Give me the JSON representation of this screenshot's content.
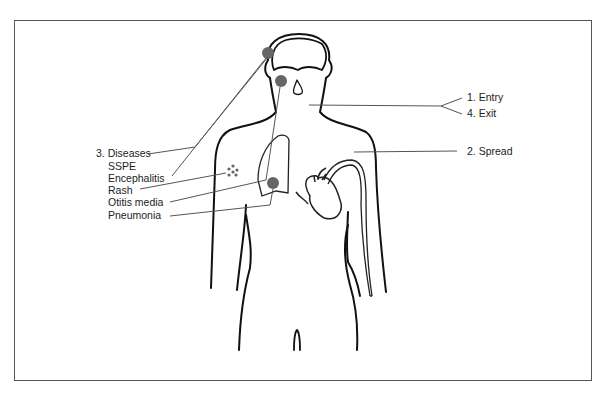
{
  "diagram": {
    "labels_right": {
      "entry": "1. Entry",
      "exit": "4. Exit",
      "spread": "2. Spread"
    },
    "diseases": {
      "heading": "3. Diseases",
      "items": [
        "SSPE",
        "Encephalitis",
        "Rash",
        "Otitis media",
        "Pneumonia"
      ]
    },
    "colors": {
      "outline": "#111111",
      "leader_line": "#555555",
      "infection_dot": "#666666",
      "frame": "#555555"
    }
  }
}
